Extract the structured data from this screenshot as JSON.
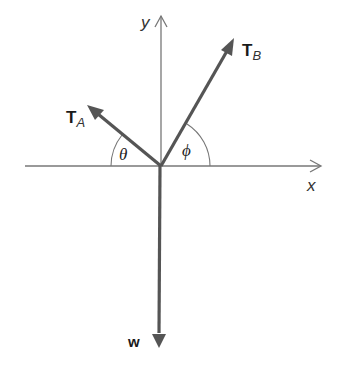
{
  "diagram": {
    "type": "free-body-diagram",
    "axes": {
      "x_label": "x",
      "y_label": "y"
    },
    "vectors": [
      {
        "id": "TA",
        "main": "T",
        "sub": "A",
        "direction": "upper-left",
        "angle_symbol": "θ",
        "angle_from": "negative x-axis"
      },
      {
        "id": "TB",
        "main": "T",
        "sub": "B",
        "direction": "upper-right",
        "angle_symbol": "φ",
        "angle_from": "positive x-axis"
      },
      {
        "id": "w",
        "main": "w",
        "sub": "",
        "direction": "down"
      }
    ],
    "angles": {
      "theta": "θ",
      "phi": "ϕ"
    },
    "colors": {
      "vector": "#555555",
      "axis": "#666666",
      "background": "#ffffff"
    }
  }
}
